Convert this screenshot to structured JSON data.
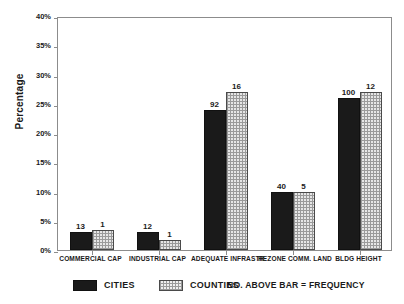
{
  "chart_data": {
    "type": "bar",
    "title": "",
    "xlabel": "",
    "ylabel": "Percentage",
    "ylim": [
      0,
      40
    ],
    "ytick_labels": [
      "0%",
      "5%",
      "10%",
      "15%",
      "20%",
      "25%",
      "30%",
      "35%",
      "40%"
    ],
    "ytick_values": [
      0,
      5,
      10,
      15,
      20,
      25,
      30,
      35,
      40
    ],
    "grid": false,
    "legend_position": "bottom",
    "categories": [
      "COMMERCIAL CAP",
      "INDUSTRIAL CAP",
      "ADEQUATE INFRASTR.",
      "REZONE COMM. LAND",
      "BLDG HEIGHT"
    ],
    "series": [
      {
        "name": "CITIES",
        "color": "#1a1a1a",
        "values": [
          3.0,
          3.0,
          24.0,
          10.0,
          26.0
        ],
        "labels": [
          "13",
          "12",
          "92",
          "40",
          "100"
        ]
      },
      {
        "name": "COUNTIES",
        "color": "#e6e6e6",
        "values": [
          3.5,
          1.7,
          27.0,
          10.0,
          27.0
        ],
        "labels": [
          "1",
          "1",
          "16",
          "5",
          "12"
        ]
      }
    ],
    "annotations": [
      "NO. ABOVE BAR = FREQUENCY"
    ]
  },
  "legend": {
    "entries": [
      {
        "label": "CITIES"
      },
      {
        "label": "COUNTIES"
      }
    ],
    "note": "NO. ABOVE BAR = FREQUENCY"
  }
}
